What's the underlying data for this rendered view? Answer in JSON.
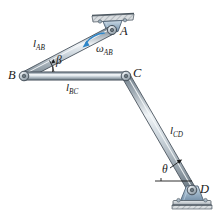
{
  "figure": {
    "type": "mechanical-linkage-diagram",
    "background_color": "#ffffff"
  },
  "colors": {
    "bar_light": "#e8edf1",
    "bar_mid": "#b9c4cc",
    "bar_dark": "#7e8b95",
    "bar_outline": "#4a555e",
    "bracket_blue": "#9fb6ca",
    "bracket_blue_dark": "#607b91",
    "ground_gray": "#c9cdd0",
    "arrow_blue": "#2f86c8",
    "label_black": "#1a1a1a"
  },
  "joints": [
    {
      "id": "A",
      "label": "A",
      "x": 112,
      "y": 30,
      "type": "pin-support-ceiling"
    },
    {
      "id": "B",
      "label": "B",
      "x": 24,
      "y": 76,
      "type": "pin-free"
    },
    {
      "id": "C",
      "label": "C",
      "x": 126,
      "y": 76,
      "type": "pin-free"
    },
    {
      "id": "D",
      "label": "D",
      "x": 192,
      "y": 190,
      "type": "pin-support-ground"
    }
  ],
  "links": [
    {
      "id": "AB",
      "label": "l",
      "subscript": "AB",
      "from": "A",
      "to": "B",
      "label_x": 33,
      "label_y": 38
    },
    {
      "id": "BC",
      "label": "l",
      "subscript": "BC",
      "from": "B",
      "to": "C",
      "label_x": 66,
      "label_y": 82
    },
    {
      "id": "CD",
      "label": "l",
      "subscript": "CD",
      "from": "C",
      "to": "D",
      "label_x": 170,
      "label_y": 125
    }
  ],
  "angles": [
    {
      "id": "beta",
      "symbol": "β",
      "label_x": 56,
      "label_y": 58,
      "at_joint": "B",
      "between": "BC and BA"
    },
    {
      "id": "theta",
      "symbol": "θ",
      "label_x": 163,
      "label_y": 166,
      "at_joint": "D",
      "between": "horizontal and DC"
    }
  ],
  "annotations": [
    {
      "id": "omega_AB",
      "symbol": "ω",
      "subscript": "AB",
      "label_x": 100,
      "label_y": 47,
      "arrow": "curved-blue-arrow",
      "arrow_color": "#2f86c8",
      "meaning": "angular velocity of link AB"
    }
  ],
  "point_labels": {
    "A": "A",
    "B": "B",
    "C": "C",
    "D": "D"
  }
}
